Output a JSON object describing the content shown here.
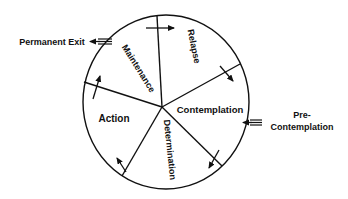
{
  "diagram": {
    "colors": {
      "line": "#111111",
      "background": "#ffffff"
    },
    "stages": [
      {
        "id": "relapse",
        "label": "Relapse"
      },
      {
        "id": "contemplation",
        "label": "Contemplation"
      },
      {
        "id": "determination",
        "label": "Determination"
      },
      {
        "id": "action",
        "label": "Action"
      },
      {
        "id": "maintenance",
        "label": "Maintenance"
      }
    ],
    "entry": {
      "label_line1": "Pre-",
      "label_line2": "Contemplation"
    },
    "exit": {
      "label": "Permanent Exit"
    }
  }
}
